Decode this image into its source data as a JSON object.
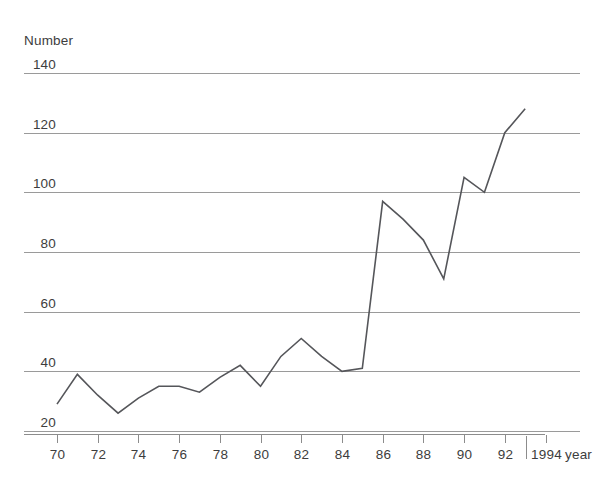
{
  "chart_data": {
    "type": "line",
    "title": "",
    "subtitle": "",
    "xlabel": "year",
    "ylabel": "Number",
    "x": [
      1970,
      1971,
      1972,
      1973,
      1974,
      1975,
      1976,
      1977,
      1978,
      1979,
      1980,
      1981,
      1982,
      1983,
      1984,
      1985,
      1986,
      1987,
      1988,
      1989,
      1990,
      1991,
      1992,
      1993
    ],
    "values": [
      29,
      39,
      32,
      26,
      31,
      35,
      35,
      33,
      38,
      42,
      35,
      45,
      51,
      45,
      40,
      41,
      97,
      91,
      84,
      71,
      105,
      100,
      120,
      128
    ],
    "series": [
      {
        "name": "Number",
        "color": "#55565a",
        "values": [
          29,
          39,
          32,
          26,
          31,
          35,
          35,
          33,
          38,
          42,
          35,
          45,
          51,
          45,
          40,
          41,
          97,
          91,
          84,
          71,
          105,
          100,
          120,
          128
        ]
      }
    ],
    "xlim": [
      1969.4,
      1994.6
    ],
    "ylim": [
      14,
      147
    ],
    "y_ticks": [
      20,
      40,
      60,
      80,
      100,
      120,
      140
    ],
    "y_tick_labels": [
      "20",
      "40",
      "60",
      "80",
      "100",
      "120",
      "140"
    ],
    "x_ticks": [
      1970,
      1972,
      1974,
      1976,
      1978,
      1980,
      1982,
      1984,
      1986,
      1988,
      1990,
      1992,
      1994
    ],
    "x_tick_labels": [
      "70",
      "72",
      "74",
      "76",
      "78",
      "80",
      "82",
      "84",
      "86",
      "88",
      "90",
      "92",
      "1994"
    ],
    "grid": "horizontal",
    "legend": "none",
    "axis_break_after": 1992,
    "colors": {
      "line": "#55565a",
      "grid": "#9a9a9a",
      "axis": "#8c8c8c",
      "text": "#3d3d3d",
      "background": "#ffffff"
    }
  }
}
